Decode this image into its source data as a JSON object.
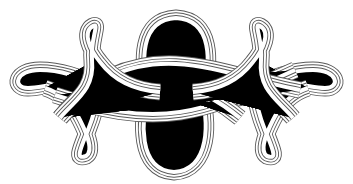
{
  "image": {
    "subject": "Decorative interlaced knot ornament",
    "style": "line drawing, multi-strand cords on white",
    "colors": {
      "background": "#ffffff",
      "line": "#5a5a5a"
    },
    "elements": [
      "left-top-loop",
      "left-side-loop",
      "left-bottom-loop",
      "central-upper-ring",
      "central-lower-ring",
      "central-crossing-bands",
      "right-top-loop",
      "right-side-loop",
      "right-bottom-loop"
    ]
  }
}
